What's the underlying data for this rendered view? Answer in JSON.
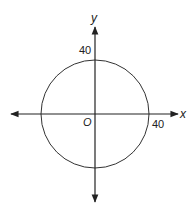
{
  "diagram": {
    "x_axis_label": "x",
    "y_axis_label": "y",
    "origin_label": "O",
    "y_intercept_label": "40",
    "x_intercept_label": "40",
    "circle": {
      "center": [
        0,
        0
      ],
      "radius": 40
    },
    "colors": {
      "stroke": "#222222",
      "background": "#ffffff"
    }
  }
}
